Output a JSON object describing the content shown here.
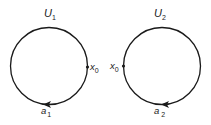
{
  "diagram": {
    "loops": [
      {
        "title": "U",
        "title_sub": "1",
        "basepoint_label": "x",
        "basepoint_sub": "0",
        "basepoint_side": "right",
        "path_label": "a",
        "path_sub": "1",
        "arrow_direction": "left-at-bottom"
      },
      {
        "title": "U",
        "title_sub": "2",
        "basepoint_label": "x",
        "basepoint_sub": "0",
        "basepoint_side": "left",
        "path_label": "a",
        "path_sub": "2",
        "arrow_direction": "left-at-bottom"
      }
    ],
    "colors": {
      "stroke": "#1a1a1a",
      "background": "#ffffff"
    }
  }
}
